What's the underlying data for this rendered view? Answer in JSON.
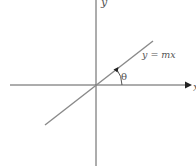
{
  "diagram": {
    "type": "coordinate-axes-with-line",
    "labels": {
      "y_axis": "y",
      "x_axis": "x",
      "line": "y = mx",
      "angle": "θ"
    },
    "colors": {
      "axes": "#5a5a5a",
      "line": "#8a8a8a",
      "text": "#555555",
      "background": "#ffffff"
    },
    "geometry": {
      "origin": [
        96,
        85
      ],
      "line_start": [
        45,
        125
      ],
      "line_end": [
        153,
        41
      ],
      "angle_arc_radius": 26
    }
  }
}
